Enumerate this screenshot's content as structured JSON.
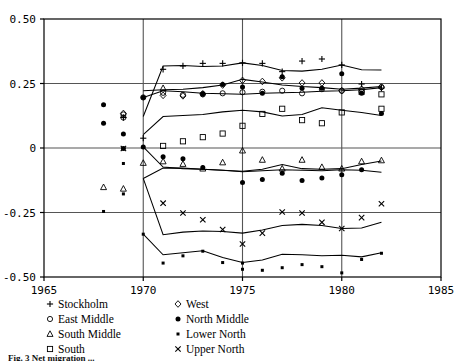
{
  "chart_data": {
    "type": "scatter",
    "title": "",
    "xlabel": "",
    "ylabel": "",
    "xlim": [
      1965,
      1985
    ],
    "ylim": [
      -0.5,
      0.5
    ],
    "xticks": [
      "1965",
      "1970",
      "1975",
      "1980",
      "1985"
    ],
    "xtick_values": [
      1965,
      1970,
      1975,
      1980,
      1985
    ],
    "yticks": [
      "0.50",
      "0.25",
      "0",
      "-0.25",
      "-0.50"
    ],
    "ytick_values": [
      0.5,
      0.25,
      0,
      -0.25,
      -0.5
    ],
    "grid": "gridlines at y = 0.25, 0, -0.25 and x = 1970, 1975, 1980",
    "legend_position": "below-plot-two-columns",
    "series": [
      {
        "name": "Stockholm",
        "marker": "plus",
        "points": [
          {
            "x": 1969.0,
            "y": 0.118
          },
          {
            "x": 1970.0,
            "y": 0.038
          },
          {
            "x": 1971.0,
            "y": 0.305
          },
          {
            "x": 1972.0,
            "y": 0.318
          },
          {
            "x": 1973.0,
            "y": 0.328
          },
          {
            "x": 1974.0,
            "y": 0.328
          },
          {
            "x": 1975.0,
            "y": 0.33
          },
          {
            "x": 1976.0,
            "y": 0.328
          },
          {
            "x": 1977.0,
            "y": 0.296
          },
          {
            "x": 1978.0,
            "y": 0.337
          },
          {
            "x": 1979.0,
            "y": 0.345
          },
          {
            "x": 1980.0,
            "y": 0.322
          },
          {
            "x": 1981.0,
            "y": 0.248
          },
          {
            "x": 1982.0,
            "y": 0.232
          }
        ],
        "line": [
          {
            "x": 1970.0,
            "y": 0.122
          },
          {
            "x": 1971.0,
            "y": 0.318
          },
          {
            "x": 1972.0,
            "y": 0.32
          },
          {
            "x": 1973.0,
            "y": 0.316
          },
          {
            "x": 1974.0,
            "y": 0.318
          },
          {
            "x": 1975.0,
            "y": 0.33
          },
          {
            "x": 1976.0,
            "y": 0.32
          },
          {
            "x": 1977.0,
            "y": 0.3
          },
          {
            "x": 1978.0,
            "y": 0.298
          },
          {
            "x": 1979.0,
            "y": 0.305
          },
          {
            "x": 1980.0,
            "y": 0.322
          },
          {
            "x": 1981.0,
            "y": 0.303
          },
          {
            "x": 1982.0,
            "y": 0.302
          }
        ]
      },
      {
        "name": "East Middle",
        "marker": "circle-open",
        "points": [
          {
            "x": 1969.0,
            "y": 0.13
          },
          {
            "x": 1969.0,
            "y": 0.118
          },
          {
            "x": 1970.0,
            "y": 0.196
          },
          {
            "x": 1971.0,
            "y": 0.214
          },
          {
            "x": 1972.0,
            "y": 0.206
          },
          {
            "x": 1973.0,
            "y": 0.208
          },
          {
            "x": 1974.0,
            "y": 0.212
          },
          {
            "x": 1975.0,
            "y": 0.216
          },
          {
            "x": 1976.0,
            "y": 0.218
          },
          {
            "x": 1977.0,
            "y": 0.222
          },
          {
            "x": 1978.0,
            "y": 0.212
          },
          {
            "x": 1979.0,
            "y": 0.228
          },
          {
            "x": 1980.0,
            "y": 0.222
          },
          {
            "x": 1981.0,
            "y": 0.218
          },
          {
            "x": 1982.0,
            "y": 0.236
          }
        ],
        "line": [
          {
            "x": 1970.0,
            "y": 0.196
          },
          {
            "x": 1971.0,
            "y": 0.222
          },
          {
            "x": 1972.0,
            "y": 0.218
          },
          {
            "x": 1973.0,
            "y": 0.212
          },
          {
            "x": 1974.0,
            "y": 0.21
          },
          {
            "x": 1975.0,
            "y": 0.208
          },
          {
            "x": 1976.0,
            "y": 0.212
          },
          {
            "x": 1977.0,
            "y": 0.214
          },
          {
            "x": 1978.0,
            "y": 0.216
          },
          {
            "x": 1979.0,
            "y": 0.22
          },
          {
            "x": 1980.0,
            "y": 0.222
          },
          {
            "x": 1981.0,
            "y": 0.226
          },
          {
            "x": 1982.0,
            "y": 0.234
          }
        ]
      },
      {
        "name": "South Middle",
        "marker": "triangle-open",
        "points": [
          {
            "x": 1968.0,
            "y": -0.152
          },
          {
            "x": 1969.0,
            "y": -0.158
          },
          {
            "x": 1970.0,
            "y": -0.058
          },
          {
            "x": 1971.0,
            "y": 0.232
          },
          {
            "x": 1971.0,
            "y": -0.052
          },
          {
            "x": 1972.0,
            "y": -0.062
          },
          {
            "x": 1973.0,
            "y": -0.08
          },
          {
            "x": 1974.0,
            "y": -0.056
          },
          {
            "x": 1975.0,
            "y": -0.01
          },
          {
            "x": 1976.0,
            "y": -0.046
          },
          {
            "x": 1977.0,
            "y": -0.08
          },
          {
            "x": 1978.0,
            "y": -0.046
          },
          {
            "x": 1979.0,
            "y": -0.074
          },
          {
            "x": 1980.0,
            "y": -0.08
          },
          {
            "x": 1981.0,
            "y": -0.052
          },
          {
            "x": 1982.0,
            "y": -0.048
          }
        ],
        "line": [
          {
            "x": 1970.0,
            "y": -0.118
          },
          {
            "x": 1971.0,
            "y": -0.078
          },
          {
            "x": 1972.0,
            "y": -0.078
          },
          {
            "x": 1973.0,
            "y": -0.082
          },
          {
            "x": 1974.0,
            "y": -0.086
          },
          {
            "x": 1975.0,
            "y": -0.09
          },
          {
            "x": 1976.0,
            "y": -0.082
          },
          {
            "x": 1977.0,
            "y": -0.064
          },
          {
            "x": 1978.0,
            "y": -0.08
          },
          {
            "x": 1979.0,
            "y": -0.082
          },
          {
            "x": 1980.0,
            "y": -0.08
          },
          {
            "x": 1981.0,
            "y": -0.064
          },
          {
            "x": 1982.0,
            "y": -0.05
          }
        ]
      },
      {
        "name": "South",
        "marker": "square-open",
        "points": [
          {
            "x": 1971.0,
            "y": 0.008
          },
          {
            "x": 1972.0,
            "y": 0.026
          },
          {
            "x": 1973.0,
            "y": 0.042
          },
          {
            "x": 1974.0,
            "y": 0.056
          },
          {
            "x": 1975.0,
            "y": 0.086
          },
          {
            "x": 1976.0,
            "y": 0.132
          },
          {
            "x": 1977.0,
            "y": 0.152
          },
          {
            "x": 1978.0,
            "y": 0.108
          },
          {
            "x": 1979.0,
            "y": 0.096
          },
          {
            "x": 1980.0,
            "y": 0.138
          },
          {
            "x": 1981.0,
            "y": 0.218
          },
          {
            "x": 1982.0,
            "y": 0.208
          },
          {
            "x": 1982.0,
            "y": 0.152
          }
        ],
        "line": [
          {
            "x": 1970.0,
            "y": 0.052
          },
          {
            "x": 1971.0,
            "y": 0.122
          },
          {
            "x": 1972.0,
            "y": 0.126
          },
          {
            "x": 1973.0,
            "y": 0.13
          },
          {
            "x": 1974.0,
            "y": 0.14
          },
          {
            "x": 1975.0,
            "y": 0.146
          },
          {
            "x": 1976.0,
            "y": 0.14
          },
          {
            "x": 1977.0,
            "y": 0.124
          },
          {
            "x": 1978.0,
            "y": 0.13
          },
          {
            "x": 1979.0,
            "y": 0.156
          },
          {
            "x": 1980.0,
            "y": 0.146
          },
          {
            "x": 1981.0,
            "y": 0.138
          },
          {
            "x": 1982.0,
            "y": 0.126
          }
        ]
      },
      {
        "name": "West",
        "marker": "diamond-open",
        "points": [
          {
            "x": 1969.0,
            "y": 0.134
          },
          {
            "x": 1971.0,
            "y": 0.204
          },
          {
            "x": 1972.0,
            "y": 0.202
          },
          {
            "x": 1973.0,
            "y": 0.21
          },
          {
            "x": 1974.0,
            "y": 0.244
          },
          {
            "x": 1975.0,
            "y": 0.262
          },
          {
            "x": 1976.0,
            "y": 0.258
          },
          {
            "x": 1977.0,
            "y": 0.272
          },
          {
            "x": 1978.0,
            "y": 0.252
          },
          {
            "x": 1979.0,
            "y": 0.252
          },
          {
            "x": 1980.0,
            "y": 0.222
          },
          {
            "x": 1981.0,
            "y": 0.228
          },
          {
            "x": 1982.0,
            "y": 0.236
          }
        ],
        "line": [
          {
            "x": 1970.0,
            "y": 0.222
          },
          {
            "x": 1971.0,
            "y": 0.226
          },
          {
            "x": 1972.0,
            "y": 0.228
          },
          {
            "x": 1973.0,
            "y": 0.234
          },
          {
            "x": 1974.0,
            "y": 0.244
          },
          {
            "x": 1975.0,
            "y": 0.266
          },
          {
            "x": 1976.0,
            "y": 0.256
          },
          {
            "x": 1977.0,
            "y": 0.244
          },
          {
            "x": 1978.0,
            "y": 0.238
          },
          {
            "x": 1979.0,
            "y": 0.234
          },
          {
            "x": 1980.0,
            "y": 0.228
          },
          {
            "x": 1981.0,
            "y": 0.232
          },
          {
            "x": 1982.0,
            "y": 0.238
          }
        ]
      },
      {
        "name": "North Middle",
        "marker": "circle-filled",
        "points": [
          {
            "x": 1968.0,
            "y": 0.168
          },
          {
            "x": 1968.0,
            "y": 0.096
          },
          {
            "x": 1969.0,
            "y": 0.054
          },
          {
            "x": 1969.0,
            "y": -0.002
          },
          {
            "x": 1970.0,
            "y": 0.196
          },
          {
            "x": 1970.0,
            "y": 0.004
          },
          {
            "x": 1971.0,
            "y": -0.034
          },
          {
            "x": 1972.0,
            "y": -0.042
          },
          {
            "x": 1973.0,
            "y": 0.21
          },
          {
            "x": 1973.0,
            "y": -0.076
          },
          {
            "x": 1974.0,
            "y": 0.246
          },
          {
            "x": 1975.0,
            "y": 0.236
          },
          {
            "x": 1975.0,
            "y": -0.134
          },
          {
            "x": 1976.0,
            "y": 0.212
          },
          {
            "x": 1976.0,
            "y": -0.122
          },
          {
            "x": 1977.0,
            "y": 0.276
          },
          {
            "x": 1977.0,
            "y": -0.098
          },
          {
            "x": 1978.0,
            "y": 0.232
          },
          {
            "x": 1978.0,
            "y": -0.126
          },
          {
            "x": 1979.0,
            "y": 0.232
          },
          {
            "x": 1979.0,
            "y": -0.116
          },
          {
            "x": 1980.0,
            "y": 0.288
          },
          {
            "x": 1980.0,
            "y": -0.104
          },
          {
            "x": 1981.0,
            "y": 0.212
          },
          {
            "x": 1981.0,
            "y": -0.084
          },
          {
            "x": 1982.0,
            "y": 0.134
          }
        ],
        "line": [
          {
            "x": 1970.0,
            "y": 0.004
          },
          {
            "x": 1971.0,
            "y": -0.074
          },
          {
            "x": 1972.0,
            "y": -0.08
          },
          {
            "x": 1973.0,
            "y": -0.082
          },
          {
            "x": 1974.0,
            "y": -0.086
          },
          {
            "x": 1975.0,
            "y": -0.092
          },
          {
            "x": 1976.0,
            "y": -0.088
          },
          {
            "x": 1977.0,
            "y": -0.084
          },
          {
            "x": 1978.0,
            "y": -0.086
          },
          {
            "x": 1979.0,
            "y": -0.088
          },
          {
            "x": 1980.0,
            "y": -0.084
          },
          {
            "x": 1981.0,
            "y": -0.086
          },
          {
            "x": 1982.0,
            "y": -0.094
          }
        ]
      },
      {
        "name": "Lower North",
        "marker": "dot-small",
        "points": [
          {
            "x": 1968.0,
            "y": -0.246
          },
          {
            "x": 1969.0,
            "y": -0.178
          },
          {
            "x": 1969.0,
            "y": -0.06
          },
          {
            "x": 1970.0,
            "y": -0.334
          },
          {
            "x": 1971.0,
            "y": -0.446
          },
          {
            "x": 1972.0,
            "y": -0.418
          },
          {
            "x": 1973.0,
            "y": -0.4
          },
          {
            "x": 1974.0,
            "y": -0.444
          },
          {
            "x": 1975.0,
            "y": -0.446
          },
          {
            "x": 1975.0,
            "y": -0.47
          },
          {
            "x": 1976.0,
            "y": -0.474
          },
          {
            "x": 1977.0,
            "y": -0.464
          },
          {
            "x": 1978.0,
            "y": -0.452
          },
          {
            "x": 1979.0,
            "y": -0.46
          },
          {
            "x": 1980.0,
            "y": -0.484
          },
          {
            "x": 1981.0,
            "y": -0.432
          },
          {
            "x": 1982.0,
            "y": -0.408
          }
        ],
        "line": [
          {
            "x": 1970.0,
            "y": -0.334
          },
          {
            "x": 1971.0,
            "y": -0.414
          },
          {
            "x": 1972.0,
            "y": -0.406
          },
          {
            "x": 1973.0,
            "y": -0.398
          },
          {
            "x": 1974.0,
            "y": -0.424
          },
          {
            "x": 1975.0,
            "y": -0.444
          },
          {
            "x": 1976.0,
            "y": -0.434
          },
          {
            "x": 1977.0,
            "y": -0.412
          },
          {
            "x": 1978.0,
            "y": -0.414
          },
          {
            "x": 1979.0,
            "y": -0.418
          },
          {
            "x": 1980.0,
            "y": -0.416
          },
          {
            "x": 1981.0,
            "y": -0.422
          },
          {
            "x": 1982.0,
            "y": -0.406
          }
        ]
      },
      {
        "name": "Upper North",
        "marker": "cross",
        "points": [
          {
            "x": 1969.0,
            "y": -0.002
          },
          {
            "x": 1971.0,
            "y": -0.214
          },
          {
            "x": 1972.0,
            "y": -0.252
          },
          {
            "x": 1973.0,
            "y": -0.278
          },
          {
            "x": 1974.0,
            "y": -0.316
          },
          {
            "x": 1975.0,
            "y": -0.372
          },
          {
            "x": 1976.0,
            "y": -0.33
          },
          {
            "x": 1977.0,
            "y": -0.248
          },
          {
            "x": 1978.0,
            "y": -0.252
          },
          {
            "x": 1979.0,
            "y": -0.288
          },
          {
            "x": 1980.0,
            "y": -0.312
          },
          {
            "x": 1981.0,
            "y": -0.27
          },
          {
            "x": 1982.0,
            "y": -0.216
          }
        ],
        "line": [
          {
            "x": 1970.0,
            "y": -0.118
          },
          {
            "x": 1971.0,
            "y": -0.336
          },
          {
            "x": 1972.0,
            "y": -0.326
          },
          {
            "x": 1973.0,
            "y": -0.322
          },
          {
            "x": 1974.0,
            "y": -0.324
          },
          {
            "x": 1975.0,
            "y": -0.33
          },
          {
            "x": 1976.0,
            "y": -0.318
          },
          {
            "x": 1977.0,
            "y": -0.3
          },
          {
            "x": 1978.0,
            "y": -0.296
          },
          {
            "x": 1979.0,
            "y": -0.3
          },
          {
            "x": 1980.0,
            "y": -0.312
          },
          {
            "x": 1981.0,
            "y": -0.31
          },
          {
            "x": 1982.0,
            "y": -0.288
          }
        ]
      }
    ]
  },
  "legend": {
    "column1": [
      {
        "marker": "plus",
        "label": "Stockholm"
      },
      {
        "marker": "circle-open",
        "label": "East Middle"
      },
      {
        "marker": "triangle-open",
        "label": "South Middle"
      },
      {
        "marker": "square-open",
        "label": "South"
      }
    ],
    "column2": [
      {
        "marker": "diamond-open",
        "label": "West"
      },
      {
        "marker": "circle-filled",
        "label": "North Middle"
      },
      {
        "marker": "dot-small",
        "label": "Lower North"
      },
      {
        "marker": "cross",
        "label": "Upper North"
      }
    ]
  },
  "caption": {
    "text": "Fig. 3 Net migration ..."
  },
  "colors": {
    "axis": "#000000",
    "grid": "#555555",
    "marker": "#000000",
    "line": "#000000",
    "background": "#ffffff"
  }
}
